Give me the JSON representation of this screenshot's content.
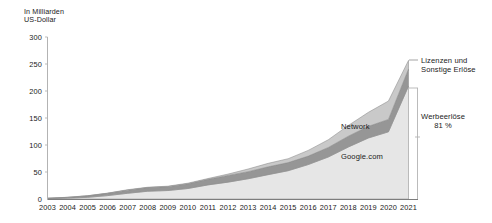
{
  "chart_data": {
    "type": "area",
    "title": "",
    "subtitle": "",
    "unit_label": "In Milliarden\nUS-Dollar",
    "xlabel": "",
    "ylabel": "In Milliarden US-Dollar",
    "ylim": [
      0,
      300
    ],
    "yticks": [
      0,
      50,
      100,
      150,
      200,
      250,
      300
    ],
    "ytick_labels": [
      "0",
      "50",
      "100",
      "150",
      "200",
      "250",
      "300"
    ],
    "grid": false,
    "legend_position": "inline-annotations",
    "stacked": true,
    "categories": [
      "2003",
      "2004",
      "2005",
      "2006",
      "2007",
      "2008",
      "2009",
      "2010",
      "2011",
      "2012",
      "2013",
      "2014",
      "2015",
      "2016",
      "2017",
      "2018",
      "2019",
      "2020",
      "2021"
    ],
    "series": [
      {
        "name": "Google.com",
        "color": "#e6e6e6",
        "values": [
          0.8,
          1.6,
          3.1,
          6.3,
          10.6,
          14.4,
          15.7,
          19.4,
          26.1,
          31.2,
          37.5,
          45.1,
          52.4,
          63.8,
          77.8,
          96.3,
          113.0,
          124.4,
          209.0
        ]
      },
      {
        "name": "Network",
        "color": "#969696",
        "values": [
          0.6,
          1.4,
          2.7,
          4.2,
          5.8,
          6.7,
          7.2,
          8.8,
          10.4,
          12.5,
          13.1,
          14.5,
          15.0,
          15.6,
          17.6,
          20.0,
          21.5,
          23.0,
          31.7
        ]
      },
      {
        "name": "Lizenzen und Sonstige Erlöse",
        "color": "#c9c9c9",
        "values": [
          0.1,
          0.2,
          0.3,
          0.4,
          0.8,
          0.7,
          0.8,
          1.1,
          1.4,
          2.4,
          4.9,
          6.4,
          7.2,
          10.6,
          14.3,
          19.9,
          26.0,
          34.0,
          16.0
        ]
      }
    ],
    "annotations": [
      {
        "name": "network-label",
        "text": "Network"
      },
      {
        "name": "google-com-label",
        "text": "Google.com"
      },
      {
        "name": "licenses-callout",
        "text": "Lizenzen und\nSonstige Erlöse"
      },
      {
        "name": "advertising-callout",
        "text": "Werbeerlöse\n81 %"
      }
    ]
  },
  "axis": {
    "unit_label": "In Milliarden\nUS-Dollar"
  },
  "callouts": {
    "licenses": "Lizenzen und\nSonstige Erlöse",
    "advertising": "Werbeerlöse\n81 %"
  },
  "inline_labels": {
    "network": "Network",
    "google_com": "Google.com"
  },
  "colors": {
    "google_com": "#e6e6e6",
    "network": "#969696",
    "licenses": "#c9c9c9",
    "axis": "#b3b3b3",
    "text": "#1a1a1a"
  }
}
